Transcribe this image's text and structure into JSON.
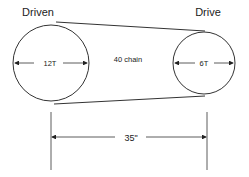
{
  "diagram": {
    "type": "chain-drive-schematic",
    "colors": {
      "line": "#333333",
      "text": "#222222",
      "background": "#ffffff"
    },
    "sprockets": {
      "driven": {
        "title": "Driven",
        "teeth_label": "12T"
      },
      "drive": {
        "title": "Drive",
        "teeth_label": "6T"
      }
    },
    "chain": {
      "label": "40 chain"
    },
    "center_distance": {
      "label": "35\""
    }
  }
}
